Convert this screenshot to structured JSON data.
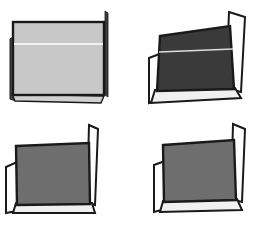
{
  "figure": {
    "type": "line-drawing",
    "background_color": "#ffffff",
    "width": 257,
    "height": 226,
    "rows": 2,
    "columns": 2,
    "outline_color": "#1a1a1a",
    "highlight_line_color": "#f2f2f2",
    "panels": [
      {
        "id": "panel-top-left",
        "position": "top-left",
        "label": "",
        "back_panel_color": "#c8c8c8",
        "back_panel_shade": "light gray",
        "wall_color": "#d8d8d8",
        "floor_color": "#d0d0d0",
        "left_flap": "dark sliver, edge-on",
        "right_flap": "thin vertical line, edge-on",
        "orientation": "front facing, walls nearly edge-on",
        "has_highlight_line": true
      },
      {
        "id": "panel-top-right",
        "position": "top-right",
        "label": "",
        "back_panel_color": "#3a3a3a",
        "back_panel_shade": "dark gray",
        "wall_color": "#ffffff",
        "floor_color": "#f0f0f0",
        "left_flap": "white parallelogram opening left",
        "right_flap": "white parallelogram opening right",
        "orientation": "rotated, both walls splayed open",
        "has_highlight_line": true
      },
      {
        "id": "panel-bottom-left",
        "position": "bottom-left",
        "label": "",
        "back_panel_color": "#6e6e6e",
        "back_panel_shade": "medium gray",
        "wall_color": "#ffffff",
        "floor_color": "#f0f0f0",
        "left_flap": "narrow white wall",
        "right_flap": "narrow white flap angled back",
        "orientation": "tilted, narrow walls",
        "has_highlight_line": false
      },
      {
        "id": "panel-bottom-right",
        "position": "bottom-right",
        "label": "",
        "back_panel_color": "#6e6e6e",
        "back_panel_shade": "medium gray",
        "wall_color": "#ffffff",
        "floor_color": "#f0f0f0",
        "left_flap": "narrow white wall",
        "right_flap": "white flap angled back",
        "orientation": "tilted, narrow walls mirrored",
        "has_highlight_line": false
      }
    ]
  }
}
